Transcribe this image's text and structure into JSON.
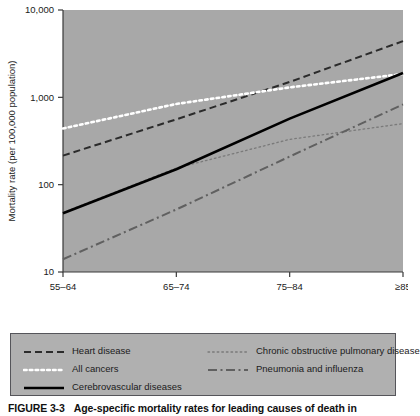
{
  "figure": {
    "caption_number": "FIGURE 3-3",
    "caption_text": "Age-specific mortality rates for leading causes of death in"
  },
  "colors": {
    "plot_background": "#a8a8a8",
    "legend_background": "#b0b0b0",
    "axis": "#3a3a3a",
    "heart_disease": "#2b2b2b",
    "all_cancers": "#ffffff",
    "cerebrovascular": "#000000",
    "copd": "#7a7a7a",
    "pneumonia": "#606060",
    "text": "#1a1a1a"
  },
  "chart_data": {
    "type": "line",
    "title": "",
    "xlabel": "Age (years)",
    "ylabel": "Mortality rate (per 100,000 population)",
    "x_categories": [
      "55–64",
      "65–74",
      "75–84",
      "≥85"
    ],
    "y_tick_labels": [
      "10",
      "100",
      "1,000",
      "10,000"
    ],
    "y_tick_values": [
      10,
      100,
      1000,
      10000
    ],
    "yscale": "log",
    "ylim": [
      10,
      10000
    ],
    "grid": false,
    "legend_position": "below",
    "series": [
      {
        "name": "Heart disease",
        "style": "dashed",
        "color": "#2b2b2b",
        "values": [
          215,
          560,
          1500,
          4400
        ]
      },
      {
        "name": "All cancers",
        "style": "dotted-thick",
        "color": "#ffffff",
        "values": [
          440,
          840,
          1300,
          1850
        ]
      },
      {
        "name": "Cerebrovascular diseases",
        "style": "solid",
        "color": "#000000",
        "values": [
          47,
          150,
          570,
          1900
        ]
      },
      {
        "name": "Chronic obstructive pulmonary disease",
        "style": "dotted-fine",
        "color": "#7a7a7a",
        "values": [
          48,
          155,
          330,
          500
        ]
      },
      {
        "name": "Pneumonia and influenza",
        "style": "dash-dot",
        "color": "#606060",
        "values": [
          14,
          52,
          210,
          830
        ]
      }
    ]
  },
  "legend": {
    "items": [
      {
        "label": "Heart disease",
        "style": "dashed"
      },
      {
        "label": "Chronic obstructive pulmonary disease",
        "style": "dotted-fine"
      },
      {
        "label": "All cancers",
        "style": "dotted-thick"
      },
      {
        "label": "Pneumonia and influenza",
        "style": "dash-dot"
      },
      {
        "label": "Cerebrovascular diseases",
        "style": "solid"
      }
    ]
  }
}
